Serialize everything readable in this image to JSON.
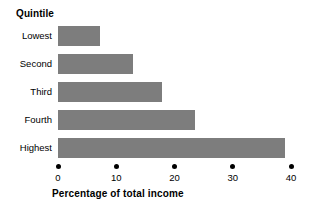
{
  "chart_data": {
    "type": "bar",
    "orientation": "horizontal",
    "title": "",
    "xlabel": "Percentage of total income",
    "ylabel": "Quintile",
    "categories": [
      "Lowest",
      "Second",
      "Third",
      "Fourth",
      "Highest"
    ],
    "values": [
      7.2,
      12.9,
      17.8,
      23.5,
      38.9
    ],
    "series": [
      {
        "name": "Percentage of total income",
        "values": [
          7.2,
          12.9,
          17.8,
          23.5,
          38.9
        ]
      }
    ],
    "xlim": [
      0,
      40
    ],
    "xticks": [
      0,
      10,
      20,
      30,
      40
    ],
    "xtick_labels": [
      "0",
      "10",
      "20",
      "30",
      "40"
    ],
    "grid": false,
    "legend": false,
    "bar_color": "#7d7d7d",
    "axis_color": "#000000",
    "background_color": "#ffffff"
  }
}
